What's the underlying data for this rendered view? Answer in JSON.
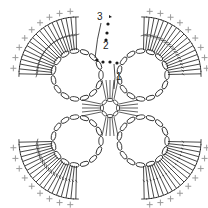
{
  "diagram": {
    "type": "crochet-chart",
    "center": [
      110,
      108
    ],
    "round_labels": [
      {
        "text": "3",
        "x": 97,
        "y": 20
      },
      {
        "text": "2",
        "x": 103,
        "y": 49
      },
      {
        "text": "1",
        "x": 116,
        "y": 80
      }
    ],
    "colors": {
      "stitch": "#1a1a1a",
      "outer_round": "#9a9a9a",
      "background": "#ffffff"
    },
    "legend": []
  }
}
